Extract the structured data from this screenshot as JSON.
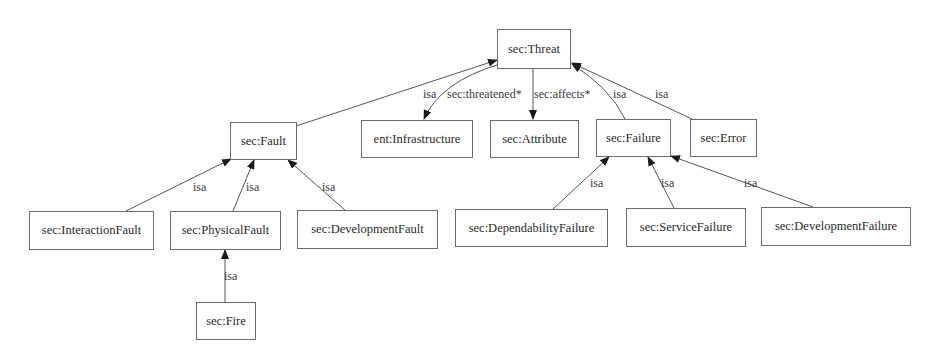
{
  "diagram": {
    "type": "ontology-class-hierarchy",
    "nodes": {
      "threat": {
        "label": "sec:Threat"
      },
      "fault": {
        "label": "sec:Fault"
      },
      "infrastructure": {
        "label": "ent:Infrastructure"
      },
      "attribute": {
        "label": "sec:Attribute"
      },
      "failure": {
        "label": "sec:Failure"
      },
      "error": {
        "label": "sec:Error"
      },
      "interaction_fault": {
        "label": "sec:InteractionFault"
      },
      "physical_fault": {
        "label": "sec:PhysicalFault"
      },
      "development_fault": {
        "label": "sec:DevelopmentFault"
      },
      "dependability_failure": {
        "label": "sec:DependabilityFailure"
      },
      "service_failure": {
        "label": "sec:ServiceFailure"
      },
      "development_failure": {
        "label": "sec:DevelopmentFailure"
      },
      "fire": {
        "label": "sec:Fire"
      }
    },
    "edges": {
      "fault_threat": {
        "from": "sec:Fault",
        "to": "sec:Threat",
        "label": "isa"
      },
      "threat_infrastructure": {
        "from": "sec:Threat",
        "to": "ent:Infrastructure",
        "label": "sec:threatened*"
      },
      "threat_attribute": {
        "from": "sec:Threat",
        "to": "sec:Attribute",
        "label": "sec:affects*"
      },
      "failure_threat": {
        "from": "sec:Failure",
        "to": "sec:Threat",
        "label": "isa"
      },
      "error_threat": {
        "from": "sec:Error",
        "to": "sec:Threat",
        "label": "isa"
      },
      "interaction_fault_fault": {
        "from": "sec:InteractionFault",
        "to": "sec:Fault",
        "label": "isa"
      },
      "physical_fault_fault": {
        "from": "sec:PhysicalFault",
        "to": "sec:Fault",
        "label": "isa"
      },
      "development_fault_fault": {
        "from": "sec:DevelopmentFault",
        "to": "sec:Fault",
        "label": "isa"
      },
      "dependability_failure_failure": {
        "from": "sec:DependabilityFailure",
        "to": "sec:Failure",
        "label": "isa"
      },
      "service_failure_failure": {
        "from": "sec:ServiceFailure",
        "to": "sec:Failure",
        "label": "isa"
      },
      "development_failure_failure": {
        "from": "sec:DevelopmentFailure",
        "to": "sec:Failure",
        "label": "isa"
      },
      "fire_physical_fault": {
        "from": "sec:Fire",
        "to": "sec:PhysicalFault",
        "label": "isa"
      }
    },
    "colors": {
      "node_border": "#6a6a6a",
      "edge": "#555555",
      "text": "#2a2a2a",
      "background": "#ffffff"
    }
  }
}
